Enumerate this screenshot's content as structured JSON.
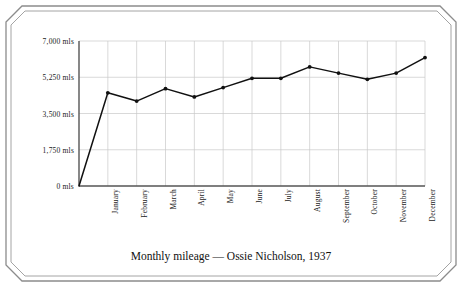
{
  "chart_data": {
    "type": "line",
    "title": "Monthly mileage — Ossie Nicholson, 1937",
    "xlabel": "",
    "ylabel": "",
    "categories": [
      "January",
      "February",
      "March",
      "April",
      "May",
      "June",
      "July",
      "August",
      "September",
      "October",
      "November",
      "December"
    ],
    "values": [
      4500,
      4100,
      4700,
      4300,
      4750,
      5200,
      5200,
      5750,
      5450,
      5150,
      5450,
      6200
    ],
    "series": [
      {
        "name": "Monthly mileage",
        "values": [
          4500,
          4100,
          4700,
          4300,
          4750,
          5200,
          5200,
          5750,
          5450,
          5150,
          5450,
          6200
        ]
      }
    ],
    "ylim": [
      0,
      7000
    ],
    "y_ticks": [
      0,
      1750,
      3500,
      5250,
      7000
    ],
    "y_tick_labels": [
      "0 mls",
      "1,750 mls",
      "3,500 mls",
      "5,250 mls",
      "7,000 mls"
    ],
    "unit": "mls",
    "grid": true,
    "legend": false,
    "marker": "dot",
    "line_color": "#111111",
    "grid_color": "#c8c8c8",
    "axis_color": "#555555",
    "origin_value": 0,
    "starts_at_origin": true
  },
  "caption": {
    "text": "Monthly mileage — Ossie Nicholson, 1937"
  },
  "y_axis": {
    "ticks": [
      {
        "label": "7,000 mls",
        "value": 7000
      },
      {
        "label": "5,250 mls",
        "value": 5250
      },
      {
        "label": "3,500 mls",
        "value": 3500
      },
      {
        "label": "1,750 mls",
        "value": 1750
      },
      {
        "label": "0 mls",
        "value": 0
      }
    ]
  },
  "x_axis": {
    "ticks": [
      {
        "label": "January"
      },
      {
        "label": "February"
      },
      {
        "label": "March"
      },
      {
        "label": "April"
      },
      {
        "label": "May"
      },
      {
        "label": "June"
      },
      {
        "label": "July"
      },
      {
        "label": "August"
      },
      {
        "label": "September"
      },
      {
        "label": "October"
      },
      {
        "label": "November"
      },
      {
        "label": "December"
      }
    ]
  }
}
